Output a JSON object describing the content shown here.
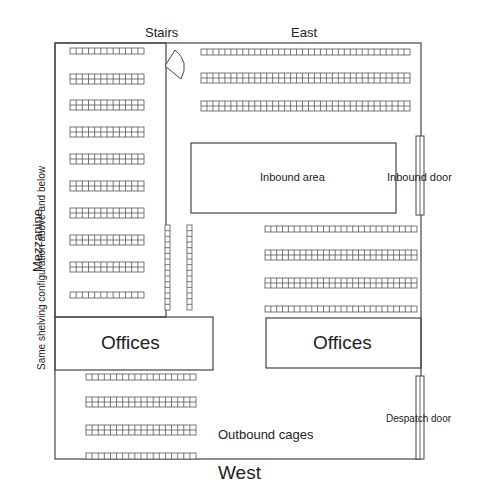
{
  "plan": {
    "compass": {
      "north_side": "Stairs",
      "east": "East",
      "west": "West"
    },
    "labels": {
      "stairs": "Stairs",
      "east": "East",
      "west": "West",
      "mezzanine": "Mezzanine",
      "mezzanine_note": "Same shelving configuration above and below",
      "offices_left": "Offices",
      "offices_right": "Offices",
      "inbound_area": "Inbound area",
      "inbound_door": "Inbound door",
      "despatch_door": "Despatch door",
      "outbound_cages": "Outbound cages"
    },
    "zones": [
      {
        "name": "Mezzanine",
        "x": 55,
        "y": 43,
        "w": 111,
        "h": 274
      },
      {
        "name": "Offices (left)",
        "x": 55,
        "y": 317,
        "w": 158,
        "h": 53
      },
      {
        "name": "Offices (right)",
        "x": 266,
        "y": 318,
        "w": 155,
        "h": 50
      },
      {
        "name": "Inbound area",
        "x": 191,
        "y": 143,
        "w": 205,
        "h": 70
      },
      {
        "name": "Inbound door",
        "x": 416,
        "y": 136,
        "w": 8,
        "h": 79
      },
      {
        "name": "Despatch door",
        "x": 416,
        "y": 376,
        "w": 8,
        "h": 83
      }
    ],
    "shelving": {
      "mezzanine_racks": 11,
      "east_racks": 3,
      "center_racks": 4,
      "vertical_racks": 2,
      "outbound_racks": 4
    }
  }
}
